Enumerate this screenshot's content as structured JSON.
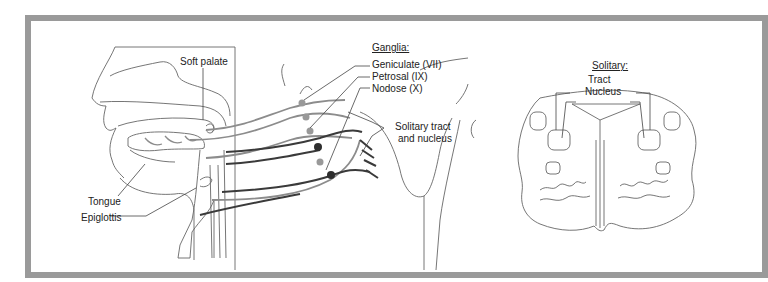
{
  "figure": {
    "colors": {
      "frame_border": "#9a9a9a",
      "outline": "#666666",
      "nerve_light": "#8c8c8c",
      "nerve_dark": "#3a3a3a",
      "ganglion_light": "#999999",
      "ganglion_dark": "#2e2e2e"
    }
  },
  "left_panel": {
    "labels": {
      "soft_palate": "Soft palate",
      "tongue": "Tongue",
      "epiglottis": "Epiglottis"
    }
  },
  "ganglia_panel": {
    "heading": "Ganglia:",
    "items": [
      {
        "label": "Geniculate (VII)"
      },
      {
        "label": "Petrosal (IX)"
      },
      {
        "label": "Nodose (X)"
      }
    ],
    "solitary_label_line1": "Solitary tract",
    "solitary_label_line2": "and nucleus"
  },
  "medulla_panel": {
    "heading": "Solitary:",
    "tract": "Tract",
    "nucleus": "Nucleus"
  }
}
